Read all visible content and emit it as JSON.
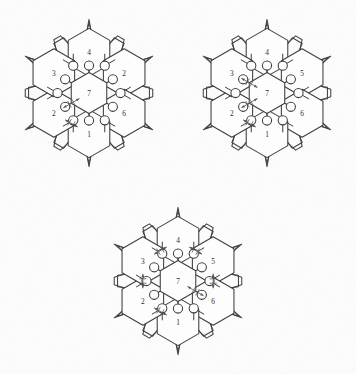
{
  "figure": {
    "background_color": "#fdfdfd",
    "line_color": "#3a3a3a",
    "label_color": "#2b2b2b",
    "arrow_color": "#555555",
    "canvas": {
      "width": 356,
      "height": 374
    }
  },
  "clusters": [
    {
      "id": "cluster-top-left",
      "name": "top-left-cluster",
      "center": {
        "x": 89,
        "y": 93
      },
      "center_label": "7",
      "peripheral_labels": {
        "top": "4",
        "upper_right": "2",
        "lower_right": "6",
        "bottom": "1",
        "lower_left": "2",
        "upper_left": "3"
      },
      "arrows": [
        {
          "name": "arrow-lowerleft-to-center",
          "from": "lower_left",
          "to": "center",
          "style": "double-headed-ticked"
        },
        {
          "name": "arrow-lowerleft-to-bottom",
          "from": "lower_left",
          "to": "bottom",
          "style": "double-headed-ticked"
        }
      ]
    },
    {
      "id": "cluster-top-right",
      "name": "top-right-cluster",
      "center": {
        "x": 267,
        "y": 93
      },
      "center_label": "7",
      "peripheral_labels": {
        "top": "4",
        "upper_right": "5",
        "lower_right": "6",
        "bottom": "1",
        "lower_left": "2",
        "upper_left": "3"
      },
      "arrows": [
        {
          "name": "arrow-upperleft-to-center",
          "from": "upper_left",
          "to": "center",
          "style": "double-headed-ticked"
        },
        {
          "name": "arrow-lowerleft-to-center",
          "from": "lower_left",
          "to": "center",
          "style": "double-headed-ticked"
        },
        {
          "name": "arrow-lowerleft-to-bottom",
          "from": "lower_left",
          "to": "bottom",
          "style": "double-headed-ticked"
        }
      ]
    },
    {
      "id": "cluster-bottom-center",
      "name": "bottom-center-cluster",
      "center": {
        "x": 178,
        "y": 281
      },
      "center_label": "7",
      "peripheral_labels": {
        "top": "4",
        "upper_right": "5",
        "lower_right": "6",
        "bottom": "1",
        "lower_left": "2",
        "upper_left": "3"
      },
      "arrows": [
        {
          "name": "arrow-upperleft-to-top",
          "from": "upper_left",
          "to": "top",
          "style": "double-headed-ticked"
        },
        {
          "name": "arrow-upperright-to-top",
          "from": "upper_right",
          "to": "top",
          "style": "double-headed-ticked"
        },
        {
          "name": "arrow-upperleft-to-lowerleft",
          "from": "upper_left",
          "to": "lower_left",
          "style": "vertical-double-headed-ticked"
        },
        {
          "name": "arrow-upperright-to-lowerright",
          "from": "upper_right",
          "to": "lower_right",
          "style": "vertical-double-headed-ticked"
        },
        {
          "name": "arrow-center-to-lowerright",
          "from": "center",
          "to": "lower_right",
          "style": "double-headed-ticked"
        },
        {
          "name": "arrow-lowerleft-to-bottom",
          "from": "lower_left",
          "to": "bottom",
          "style": "double-headed-ticked"
        }
      ]
    }
  ]
}
